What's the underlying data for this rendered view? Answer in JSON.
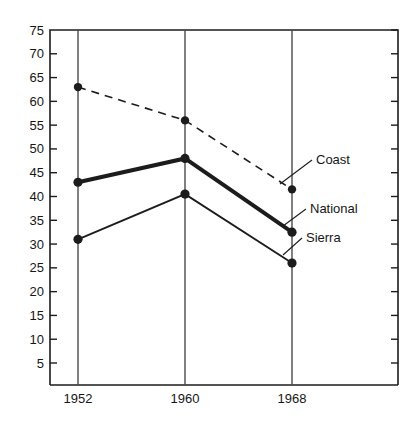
{
  "chart_data": {
    "type": "line",
    "title": "",
    "subtitle": "",
    "xlabel": "",
    "ylabel": "",
    "categories": [
      "1952",
      "1960",
      "1968"
    ],
    "x": [
      1952,
      1960,
      1968
    ],
    "xlim": [
      1952,
      1968
    ],
    "ylim": [
      0,
      75
    ],
    "y_ticks": [
      5,
      10,
      15,
      20,
      25,
      30,
      35,
      40,
      45,
      50,
      55,
      60,
      65,
      70,
      75
    ],
    "y_tick_labels": [
      "5",
      "10",
      "15",
      "20",
      "25",
      "30",
      "35",
      "40",
      "45",
      "50",
      "55",
      "60",
      "65",
      "70",
      "75"
    ],
    "x_ticks": [
      1952,
      1960,
      1968
    ],
    "x_tick_labels": [
      "1952",
      "1960",
      "1968"
    ],
    "grid": "vertical-only",
    "legend_position": "inline-right-labels",
    "series": [
      {
        "name": "Coast",
        "label": "Coast",
        "style": "dashed",
        "line_width": 1.6,
        "color": "#1c1c1c",
        "marker": "circle",
        "values": [
          63,
          56,
          41.5
        ]
      },
      {
        "name": "National",
        "label": "National",
        "style": "solid",
        "line_width": 4.0,
        "color": "#1c1c1c",
        "marker": "circle",
        "values": [
          43,
          48,
          32.5
        ]
      },
      {
        "name": "Sierra",
        "label": "Sierra",
        "style": "solid",
        "line_width": 1.8,
        "color": "#1c1c1c",
        "marker": "circle",
        "values": [
          31,
          40.5,
          26
        ]
      }
    ],
    "annotations": [
      {
        "text": "Coast",
        "for_series": "Coast",
        "at_category": "1968"
      },
      {
        "text": "National",
        "for_series": "National",
        "at_category": "1968"
      },
      {
        "text": "Sierra",
        "for_series": "Sierra",
        "at_category": "1968"
      }
    ]
  },
  "axes": {
    "y_labels": [
      "75",
      "70",
      "65",
      "60",
      "55",
      "50",
      "45",
      "40",
      "35",
      "30",
      "25",
      "20",
      "15",
      "10",
      "5"
    ],
    "x_labels": [
      "1952",
      "1960",
      "1968"
    ]
  },
  "labels": {
    "coast": "Coast",
    "national": "National",
    "sierra": "Sierra"
  },
  "colors": {
    "ink": "#1c1c1c",
    "grid": "#4a4a4a",
    "background": "#ffffff"
  }
}
